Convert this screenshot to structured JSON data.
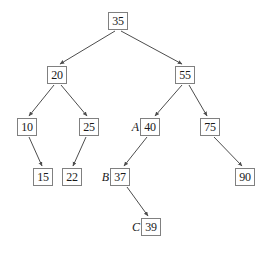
{
  "figure": {
    "type": "binary-search-tree-diagram",
    "title": "",
    "background_color": "#ffffff",
    "node_border_color": "#808080",
    "edge_color": "#4d4d4d",
    "text_color": "#1a1a1a"
  },
  "nodes": [
    {
      "id": "n35",
      "value": "35",
      "label": "",
      "x": 108,
      "y": 12
    },
    {
      "id": "n20",
      "value": "20",
      "label": "",
      "x": 47,
      "y": 66
    },
    {
      "id": "n55",
      "value": "55",
      "label": "",
      "x": 175,
      "y": 66
    },
    {
      "id": "n10",
      "value": "10",
      "label": "",
      "x": 17,
      "y": 118
    },
    {
      "id": "n25",
      "value": "25",
      "label": "",
      "x": 79,
      "y": 118
    },
    {
      "id": "n40",
      "value": "40",
      "label": "A",
      "x": 140,
      "y": 118
    },
    {
      "id": "n75",
      "value": "75",
      "label": "",
      "x": 200,
      "y": 118
    },
    {
      "id": "n15",
      "value": "15",
      "label": "",
      "x": 33,
      "y": 168
    },
    {
      "id": "n22",
      "value": "22",
      "label": "",
      "x": 62,
      "y": 168
    },
    {
      "id": "n37",
      "value": "37",
      "label": "B",
      "x": 110,
      "y": 168
    },
    {
      "id": "n90",
      "value": "90",
      "label": "",
      "x": 235,
      "y": 168
    },
    {
      "id": "n39",
      "value": "39",
      "label": "C",
      "x": 141,
      "y": 218
    }
  ],
  "edges": [
    {
      "from": "n35",
      "to": "n20",
      "x1": 115,
      "y1": 31,
      "x2": 60,
      "y2": 64
    },
    {
      "from": "n35",
      "to": "n55",
      "x1": 121,
      "y1": 31,
      "x2": 182,
      "y2": 64
    },
    {
      "from": "n20",
      "to": "n10",
      "x1": 54,
      "y1": 85,
      "x2": 29,
      "y2": 116
    },
    {
      "from": "n20",
      "to": "n25",
      "x1": 61,
      "y1": 85,
      "x2": 87,
      "y2": 116
    },
    {
      "from": "n55",
      "to": "n40",
      "x1": 182,
      "y1": 85,
      "x2": 155,
      "y2": 116
    },
    {
      "from": "n55",
      "to": "n75",
      "x1": 189,
      "y1": 85,
      "x2": 207,
      "y2": 116
    },
    {
      "from": "n10",
      "to": "n15",
      "x1": 29,
      "y1": 137,
      "x2": 42,
      "y2": 166
    },
    {
      "from": "n25",
      "to": "n22",
      "x1": 86,
      "y1": 137,
      "x2": 73,
      "y2": 166
    },
    {
      "from": "n40",
      "to": "n37",
      "x1": 147,
      "y1": 137,
      "x2": 124,
      "y2": 166
    },
    {
      "from": "n75",
      "to": "n90",
      "x1": 214,
      "y1": 137,
      "x2": 242,
      "y2": 166
    },
    {
      "from": "n37",
      "to": "n39",
      "x1": 127,
      "y1": 187,
      "x2": 148,
      "y2": 216
    }
  ]
}
